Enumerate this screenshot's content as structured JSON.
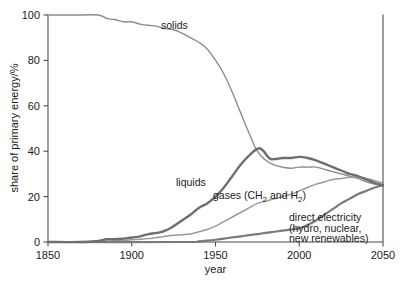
{
  "chart_data": {
    "type": "line",
    "title": "",
    "xlabel": "year",
    "ylabel": "share of primary energy/%",
    "xlim": [
      1850,
      2050
    ],
    "ylim": [
      0,
      100
    ],
    "xticks": [
      1850,
      1900,
      1950,
      2000,
      2050
    ],
    "xtick_labels": [
      "1850",
      "1900",
      "1950",
      "2000",
      "2050"
    ],
    "yticks": [
      0,
      20,
      40,
      60,
      80,
      100
    ],
    "ytick_labels": [
      "0",
      "20",
      "40",
      "60",
      "80",
      "100"
    ],
    "grid": false,
    "legend_position": "inline-annotations",
    "series": [
      {
        "name": "solids",
        "label": "solids",
        "color": "#8c8c8c",
        "width": 1.4,
        "x": [
          1850,
          1860,
          1870,
          1880,
          1885,
          1890,
          1895,
          1900,
          1905,
          1910,
          1915,
          1920,
          1925,
          1930,
          1935,
          1940,
          1945,
          1950,
          1955,
          1960,
          1965,
          1970,
          1975,
          1980,
          1985,
          1990,
          1995,
          2000,
          2005,
          2010,
          2015,
          2020,
          2025,
          2030,
          2035,
          2040,
          2045,
          2050
        ],
        "values": [
          100,
          100,
          100,
          100,
          98.5,
          98,
          97,
          97,
          96,
          95.5,
          95,
          94,
          93.5,
          92,
          90,
          88,
          85,
          80,
          74,
          66,
          57,
          48,
          40,
          36,
          34,
          33,
          32.5,
          33,
          33,
          33,
          32,
          31,
          30,
          29,
          28,
          26.5,
          25.5,
          24.5
        ]
      },
      {
        "name": "liquids",
        "label": "liquids",
        "color": "#6e6e6e",
        "width": 2.4,
        "x": [
          1850,
          1870,
          1880,
          1885,
          1890,
          1895,
          1900,
          1905,
          1910,
          1915,
          1920,
          1925,
          1930,
          1935,
          1940,
          1945,
          1950,
          1955,
          1960,
          1965,
          1970,
          1975,
          1978,
          1982,
          1985,
          1990,
          1995,
          2000,
          2005,
          2010,
          2015,
          2020,
          2025,
          2030,
          2035,
          2040,
          2045,
          2050
        ],
        "values": [
          0,
          0,
          0.5,
          1.2,
          1.2,
          1.5,
          2,
          2.5,
          3.5,
          4,
          5,
          7,
          9.5,
          12,
          15,
          17,
          20,
          24,
          29,
          34,
          38,
          41,
          40.5,
          37,
          36.5,
          37,
          37,
          37.5,
          37,
          36,
          34.5,
          33,
          31.5,
          30,
          29,
          27.5,
          26,
          25
        ]
      },
      {
        "name": "gases",
        "label": "gases (CH2 and H2)",
        "label_prefix": "gases (CH",
        "label_sub1": "2",
        "label_mid": " and H",
        "label_sub2": "2",
        "label_suffix": ")",
        "color": "#9a9a9a",
        "width": 1.5,
        "x": [
          1850,
          1880,
          1890,
          1900,
          1905,
          1910,
          1915,
          1920,
          1925,
          1930,
          1935,
          1940,
          1945,
          1950,
          1955,
          1960,
          1965,
          1970,
          1975,
          1980,
          1985,
          1990,
          1995,
          2000,
          2005,
          2010,
          2015,
          2020,
          2025,
          2030,
          2035,
          2040,
          2045,
          2050
        ],
        "values": [
          0,
          0.3,
          0.5,
          1,
          1.2,
          1.5,
          2,
          2.5,
          3,
          3.2,
          3.5,
          4.5,
          5.5,
          7,
          9,
          11,
          13,
          15,
          17,
          18,
          19,
          20,
          21,
          22.5,
          24,
          25.5,
          26.5,
          27.5,
          28,
          28.5,
          28.5,
          28,
          27,
          26
        ]
      },
      {
        "name": "direct-electricity",
        "label": "direct electricity (hydro, nuclear, new renewables)",
        "label_line1": "direct electricity",
        "label_line2": "(hydro, nuclear,",
        "label_line3": "new renewables)",
        "color": "#7a7a7a",
        "width": 2.2,
        "x": [
          1850,
          1930,
          1940,
          1945,
          1950,
          1955,
          1960,
          1965,
          1970,
          1975,
          1980,
          1985,
          1990,
          1995,
          2000,
          2005,
          2010,
          2015,
          2020,
          2025,
          2030,
          2035,
          2040,
          2045,
          2050
        ],
        "values": [
          0,
          0,
          0.3,
          0.6,
          1,
          1.5,
          2,
          2.5,
          3,
          3.5,
          4,
          4.5,
          5,
          5.5,
          6,
          7.5,
          9.5,
          12,
          14.5,
          17,
          19,
          21,
          22.5,
          24,
          25
        ]
      }
    ],
    "annotations": [
      {
        "name": "solids-label",
        "text": "solids",
        "x": 1890,
        "y": 94
      },
      {
        "name": "liquids-label",
        "text": "liquids",
        "x": 1931,
        "y": 23
      },
      {
        "name": "gases-label",
        "text": "gases (CH2 and H2)",
        "x": 1950,
        "y": 16
      },
      {
        "name": "direct-electricity-label",
        "text": "direct electricity (hydro, nuclear, new renewables)",
        "x": 1993,
        "y": 9
      }
    ]
  }
}
